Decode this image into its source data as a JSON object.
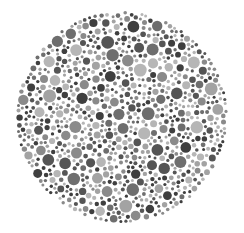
{
  "image": {
    "description": "Grayscale dot-pattern plate (Ishihara-style color vision test circle)",
    "background": "#ffffff",
    "plate": {
      "cx": 122,
      "cy": 117,
      "r": 106
    },
    "dot_shades": [
      "#3f3f3f",
      "#555555",
      "#6e6e6e",
      "#8a8a8a",
      "#a3a3a3",
      "#b6b6b6"
    ],
    "dot_radius_range": [
      1.5,
      6.5
    ],
    "seed": 1337
  }
}
